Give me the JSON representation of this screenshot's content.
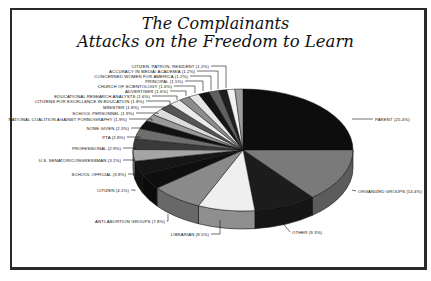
{
  "chart_data": {
    "type": "pie",
    "style": "3d-exploded-none",
    "title": "The Complainants",
    "subtitle": "Attacks on the Freedom to Learn",
    "unit": "%",
    "slices": [
      {
        "label": "PARENT",
        "value": 25.4,
        "color": "#0d0d0d"
      },
      {
        "label": "ORGANIZED GROUPS",
        "value": 14.4,
        "color": "#7a7a7a"
      },
      {
        "label": "OTHER",
        "value": 9.3,
        "color": "#1c1c1c"
      },
      {
        "label": "LIBRARIAN",
        "value": 8.5,
        "color": "#efefef"
      },
      {
        "label": "ANTI-ABORTION GROUPS",
        "value": 7.8,
        "color": "#8a8a8a"
      },
      {
        "label": "CITIZEN",
        "value": 4.1,
        "color": "#0f0f0f"
      },
      {
        "label": "SCHOOL OFFICIAL",
        "value": 3.8,
        "color": "#161616"
      },
      {
        "label": "U.S. SENATOR/CONGRESSMAN",
        "value": 3.1,
        "color": "#a5a5a5"
      },
      {
        "label": "PROFESSIONAL",
        "value": 2.9,
        "color": "#3a3a3a"
      },
      {
        "label": "PTA",
        "value": 2.8,
        "color": "#6e6e6e"
      },
      {
        "label": "NONE GIVEN",
        "value": 2.3,
        "color": "#111111"
      },
      {
        "label": "NATIONAL COALITION AGAINST PORNOGRAPHY",
        "value": 1.9,
        "color": "#9a9a9a"
      },
      {
        "label": "SCHOOL PERSONNEL",
        "value": 1.9,
        "color": "#dcdcdc"
      },
      {
        "label": "MINISTER",
        "value": 1.8,
        "color": "#555555"
      },
      {
        "label": "CITIZENS FOR EXCELLENCE IN EDUCATION",
        "value": 1.8,
        "color": "#ebebeb"
      },
      {
        "label": "EDUCATIONAL RESEARCH ANALYSTS",
        "value": 1.6,
        "color": "#8c8c8c"
      },
      {
        "label": "ADVERTISER",
        "value": 1.6,
        "color": "#e6e6e6"
      },
      {
        "label": "CHURCH OF SCIENTOLOGY",
        "value": 1.6,
        "color": "#141414"
      },
      {
        "label": "PRINCIPAL",
        "value": 1.5,
        "color": "#606060"
      },
      {
        "label": "CONCERNED WOMEN FOR AMERICA",
        "value": 1.2,
        "color": "#1e1e1e"
      },
      {
        "label": "ACCURACY IN MEDIA/ ACADEMIA",
        "value": 1.2,
        "color": "#f2f2f2"
      },
      {
        "label": "CITIZEN, PATRON, RESIDENT",
        "value": 1.2,
        "color": "#9e9e9e"
      }
    ],
    "legend": "none (leader-line labels)",
    "grid": false
  }
}
